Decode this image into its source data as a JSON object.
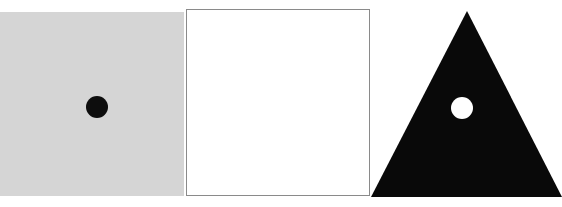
{
  "canvas": {
    "width": 562,
    "height": 207,
    "background_color": "#ffffff",
    "description": "Three geometric shape panels in a row"
  },
  "shapes": [
    {
      "name": "gray-square",
      "kind": "square",
      "fill_color": "#d5d5d5",
      "stroke_color": "none",
      "x": 0,
      "y": 12,
      "width": 184,
      "height": 184,
      "child": {
        "name": "black-dot",
        "kind": "circle",
        "fill_color": "#0d0d0d",
        "center_x": 97,
        "center_y": 107,
        "radius": 11
      }
    },
    {
      "name": "white-square",
      "kind": "square",
      "fill_color": "#ffffff",
      "stroke_color": "#8a8a8a",
      "stroke_width": 1.5,
      "x": 186,
      "y": 9,
      "width": 184,
      "height": 187,
      "child": null
    },
    {
      "name": "black-triangle",
      "kind": "triangle",
      "fill_color": "#090909",
      "stroke_color": "none",
      "apex_x": 467,
      "apex_y": 11,
      "base_left_x": 371,
      "base_right_x": 562,
      "base_y": 197,
      "child": {
        "name": "white-dot",
        "kind": "circle",
        "fill_color": "#ffffff",
        "center_x": 462,
        "center_y": 108,
        "radius": 11
      }
    }
  ],
  "triangle_geometry": {
    "points": "96,0 191,186 0,186",
    "dot_cx": 91,
    "dot_cy": 97,
    "dot_r": 11
  }
}
